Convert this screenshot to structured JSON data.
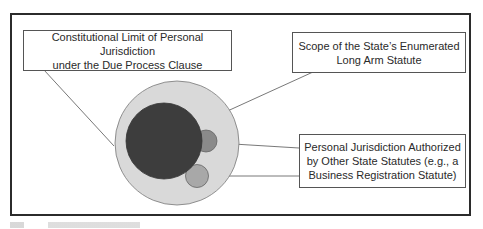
{
  "diagram": {
    "labels": {
      "due_process": [
        "Constitutional Limit of Personal Jurisdiction",
        "under the Due Process Clause"
      ],
      "long_arm": [
        "Scope of the State’s Enumerated",
        "Long Arm Statute"
      ],
      "other_statutes": [
        "Personal Jurisdiction Authorized",
        "by Other State Statutes (e.g., a",
        "Business Registration Statute)"
      ]
    },
    "colors": {
      "frame": "#2b2b2b",
      "outer_circle": "#d9d9d9",
      "long_arm_circle": "#3d3d3d",
      "other_statute_circle_1": "#8a8a8a",
      "other_statute_circle_2": "#a8a8a8",
      "leader_line": "#555555"
    }
  }
}
